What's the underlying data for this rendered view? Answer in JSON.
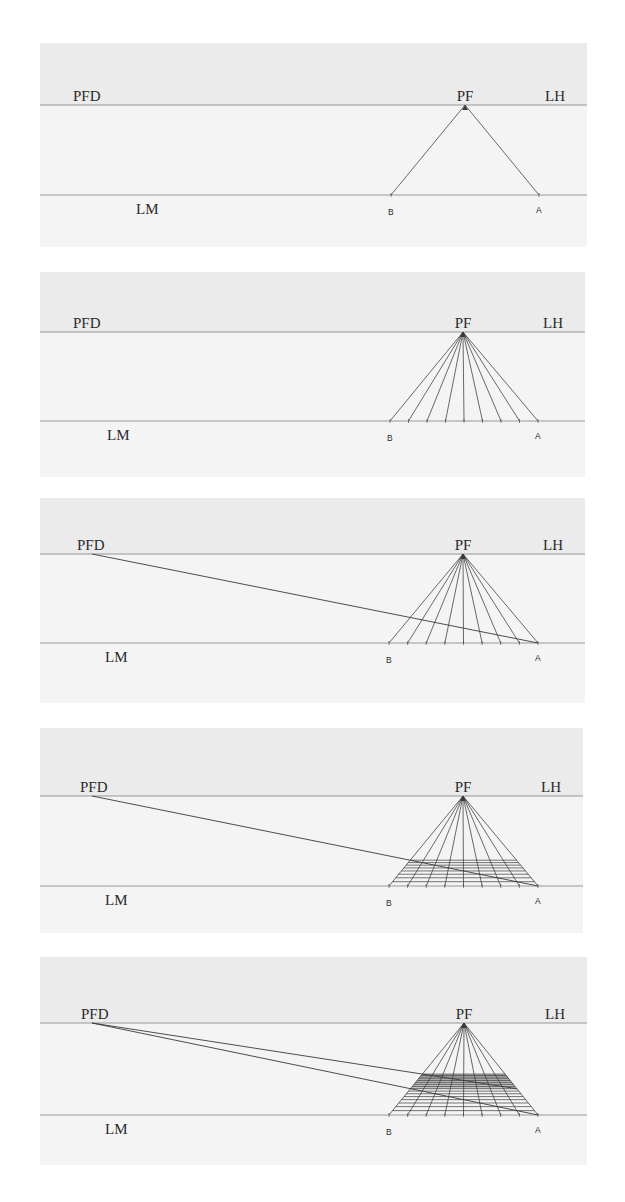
{
  "figure": {
    "colors": {
      "page_bg": "#ffffff",
      "sky_band": "#ebebeb",
      "ground_band": "#f4f4f4",
      "line": "#3a3a3a",
      "horizon_line": "#8c8c8c",
      "shade": "#9a9a9a"
    },
    "labels": {
      "distance_point": "PFD",
      "vanishing_point": "PF",
      "horizon_line": "LH",
      "ground_line": "LM",
      "point_b": "B",
      "point_a": "A"
    },
    "panels": [
      {
        "id": 1,
        "box": {
          "x": 40,
          "y": 43,
          "w": 547,
          "h": 204
        },
        "lh_y": 105,
        "lm_y": 195,
        "pf_x": 465,
        "b_x": 391,
        "a_x": 539,
        "pfd_x": 92,
        "pfd_label_x": 73,
        "lm_label_x": 136,
        "radials": 2,
        "diagonals": [],
        "grid_rows": 0,
        "shaded": false
      },
      {
        "id": 2,
        "box": {
          "x": 40,
          "y": 272,
          "w": 545,
          "h": 205
        },
        "lh_y": 332,
        "lm_y": 421,
        "pf_x": 463,
        "b_x": 390,
        "a_x": 538,
        "pfd_x": 92,
        "pfd_label_x": 73,
        "lm_label_x": 107,
        "radials": 9,
        "diagonals": [],
        "grid_rows": 0,
        "shaded": false
      },
      {
        "id": 3,
        "box": {
          "x": 40,
          "y": 498,
          "w": 545,
          "h": 205
        },
        "lh_y": 554,
        "lm_y": 643,
        "pf_x": 463,
        "b_x": 389,
        "a_x": 538,
        "pfd_x": 92,
        "pfd_label_x": 77,
        "lm_label_x": 105,
        "radials": 9,
        "diagonals": [
          "A"
        ],
        "grid_rows": 0,
        "shaded": false
      },
      {
        "id": 4,
        "box": {
          "x": 40,
          "y": 728,
          "w": 543,
          "h": 205
        },
        "lh_y": 796,
        "lm_y": 886,
        "pf_x": 463,
        "b_x": 389,
        "a_x": 538,
        "pfd_x": 92,
        "pfd_label_x": 80,
        "lm_label_x": 105,
        "radials": 9,
        "diagonals": [
          "A"
        ],
        "grid_rows": 1,
        "shaded": false
      },
      {
        "id": 5,
        "box": {
          "x": 40,
          "y": 957,
          "w": 547,
          "h": 208
        },
        "lh_y": 1023,
        "lm_y": 1115,
        "pf_x": 464,
        "b_x": 389,
        "a_x": 538,
        "pfd_x": 92,
        "pfd_label_x": 81,
        "lm_label_x": 105,
        "radials": 9,
        "diagonals": [
          "A",
          "A_row1"
        ],
        "grid_rows": 2,
        "shaded": true
      }
    ]
  }
}
